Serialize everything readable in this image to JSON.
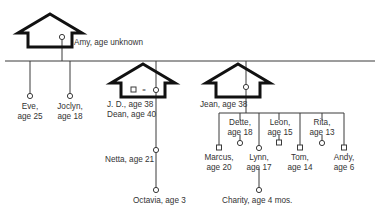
{
  "diagram": {
    "type": "genogram",
    "colors": {
      "line": "#3a3a3a",
      "house": "#111111",
      "background": "#ffffff",
      "text": "#333333"
    },
    "households": [
      {
        "id": "amy-house",
        "members": [
          "Amy"
        ]
      },
      {
        "id": "jd-dean-house",
        "members": [
          "J. D.",
          "Dean"
        ],
        "relation_symbol": "="
      },
      {
        "id": "jean-house",
        "members": [
          "Jean"
        ]
      }
    ],
    "people": {
      "amy": {
        "name": "Amy",
        "label": "Amy, age unknown",
        "sex": "female"
      },
      "eve": {
        "name": "Eve",
        "line1": "Eve,",
        "line2": "age 25",
        "sex": "female"
      },
      "joclyn": {
        "name": "Joclyn",
        "line1": "Joclyn,",
        "line2": "age 18",
        "sex": "female"
      },
      "jd": {
        "name": "J. D.",
        "label": "J. D., age 38",
        "sex": "female"
      },
      "dean": {
        "name": "Dean",
        "label": "Dean, age 40",
        "sex": "male"
      },
      "netta": {
        "name": "Netta",
        "label": "Netta, age 21",
        "sex": "female"
      },
      "octavia": {
        "name": "Octavia",
        "label": "Octavia, age 3",
        "sex": "female"
      },
      "jean": {
        "name": "Jean",
        "label": "Jean, age 38",
        "sex": "female"
      },
      "marcus": {
        "name": "Marcus",
        "line1": "Marcus,",
        "line2": "age 20",
        "sex": "male"
      },
      "dette": {
        "name": "Dette",
        "line1": "Dette,",
        "line2": "age 18",
        "sex": "female"
      },
      "lynn": {
        "name": "Lynn",
        "line1": "Lynn,",
        "line2": "age 17",
        "sex": "female"
      },
      "leon": {
        "name": "Leon",
        "line1": "Leon,",
        "line2": "age 15",
        "sex": "male"
      },
      "tom": {
        "name": "Tom",
        "line1": "Tom,",
        "line2": "age 14",
        "sex": "male"
      },
      "rita": {
        "name": "Rita",
        "line1": "Rita,",
        "line2": "age 13",
        "sex": "female"
      },
      "andy": {
        "name": "Andy",
        "line1": "Andy,",
        "line2": "age 6",
        "sex": "male"
      },
      "charity": {
        "name": "Charity",
        "label": "Charity, age 4 mos.",
        "sex": "female"
      }
    }
  }
}
